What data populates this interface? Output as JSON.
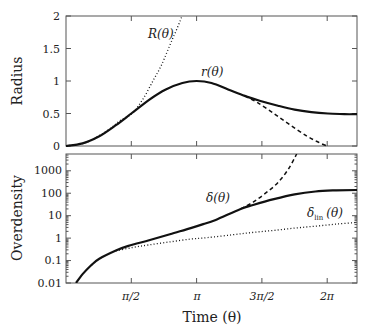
{
  "chart_data": [
    {
      "type": "line",
      "panel": "top",
      "title": "",
      "xlabel": "",
      "ylabel": "Radius",
      "xlim": [
        0,
        7.0
      ],
      "ylim": [
        0,
        2
      ],
      "yticks": [
        0,
        0.5,
        1,
        1.5,
        2
      ],
      "ytick_labels": [
        "0",
        "0.5",
        "1",
        "1.5",
        "2"
      ],
      "xticks": [
        1.5708,
        3.1416,
        4.7124,
        6.2832
      ],
      "grid": false,
      "series": [
        {
          "name": "r(θ)",
          "style": "solid",
          "x": [
            0,
            0.4,
            0.8,
            1.2,
            1.5708,
            2.0,
            2.4,
            2.8,
            3.1416,
            3.5,
            3.9,
            4.3,
            4.7,
            5.1,
            5.5,
            5.9,
            6.3,
            6.7,
            7.0
          ],
          "y": [
            0,
            0.04,
            0.15,
            0.32,
            0.5,
            0.71,
            0.87,
            0.97,
            1.0,
            0.97,
            0.87,
            0.77,
            0.69,
            0.62,
            0.56,
            0.52,
            0.5,
            0.49,
            0.49
          ]
        },
        {
          "name": "r(θ) (continued collapse)",
          "style": "dashed",
          "x": [
            4.3,
            4.6,
            5.0,
            5.4,
            5.8,
            6.1,
            6.28
          ],
          "y": [
            0.77,
            0.67,
            0.5,
            0.32,
            0.15,
            0.05,
            0.0
          ]
        },
        {
          "name": "R(θ)",
          "style": "dotted",
          "x": [
            0,
            0.5,
            1.0,
            1.3,
            1.59,
            1.85,
            2.09,
            2.3,
            2.55,
            2.7,
            2.79
          ],
          "y": [
            0,
            0.06,
            0.24,
            0.39,
            0.5,
            0.72,
            1.0,
            1.25,
            1.63,
            1.85,
            2.0
          ]
        }
      ],
      "annotations": [
        "R(θ)",
        "r(θ)"
      ]
    },
    {
      "type": "line",
      "panel": "bottom",
      "title": "",
      "xlabel": "Time (θ)",
      "ylabel": "Overdensity",
      "xlim": [
        0,
        7.0
      ],
      "ylim": [
        0.01,
        5600
      ],
      "yscale": "log",
      "yticks": [
        0.01,
        0.1,
        1,
        10,
        100,
        1000
      ],
      "ytick_labels": [
        "0.01",
        "0.1",
        "1",
        "10",
        "100",
        "1000"
      ],
      "xticks": [
        1.5708,
        3.1416,
        4.7124,
        6.2832
      ],
      "xtick_labels": [
        "π/2",
        "π",
        "3π/2",
        "2π"
      ],
      "grid": false,
      "series": [
        {
          "name": "δ(θ)",
          "style": "solid",
          "x": [
            0.24,
            0.4,
            0.6,
            0.8,
            1.2,
            1.5,
            2.0,
            2.5,
            3.0,
            3.3,
            3.6,
            4.2,
            4.5,
            5.0,
            5.5,
            6.0,
            6.5,
            7.0
          ],
          "y": [
            0.01,
            0.025,
            0.06,
            0.12,
            0.28,
            0.45,
            0.8,
            1.5,
            2.8,
            4.2,
            6.5,
            20,
            30,
            55,
            90,
            120,
            135,
            140
          ]
        },
        {
          "name": "δ(θ) (continued collapse)",
          "style": "dashed",
          "x": [
            4.2,
            4.5,
            4.8,
            5.1,
            5.35,
            5.55
          ],
          "y": [
            20,
            40,
            100,
            300,
            1200,
            5600
          ]
        },
        {
          "name": "δ_lin(θ)",
          "style": "dotted",
          "x": [
            1.2,
            1.6,
            2.0,
            2.5,
            3.0,
            3.4,
            4.0,
            4.5,
            5.0,
            5.5,
            6.0,
            6.5,
            7.0
          ],
          "y": [
            0.27,
            0.38,
            0.5,
            0.68,
            0.9,
            1.05,
            1.4,
            1.8,
            2.2,
            2.8,
            3.4,
            4.2,
            5.0
          ]
        }
      ],
      "annotations": [
        "δ(θ)",
        "δ_lin(θ)"
      ]
    }
  ],
  "top_panel": {
    "ylabel": "Radius",
    "ytick_labels": [
      "0",
      "0.5",
      "1",
      "1.5",
      "2"
    ],
    "labels": {
      "R": "R(θ)",
      "r": "r(θ)"
    }
  },
  "bottom_panel": {
    "ylabel": "Overdensity",
    "ytick_labels": [
      "0.01",
      "0.1",
      "1",
      "10",
      "100",
      "1000"
    ],
    "xtick_labels": [
      "π/2",
      "π",
      "3π/2",
      "2π"
    ],
    "xlabel": "Time (θ)",
    "labels": {
      "delta": "δ(θ)",
      "delta_lin_main": "δ",
      "delta_lin_sub": "lin",
      "delta_lin_arg": "(θ)"
    }
  }
}
